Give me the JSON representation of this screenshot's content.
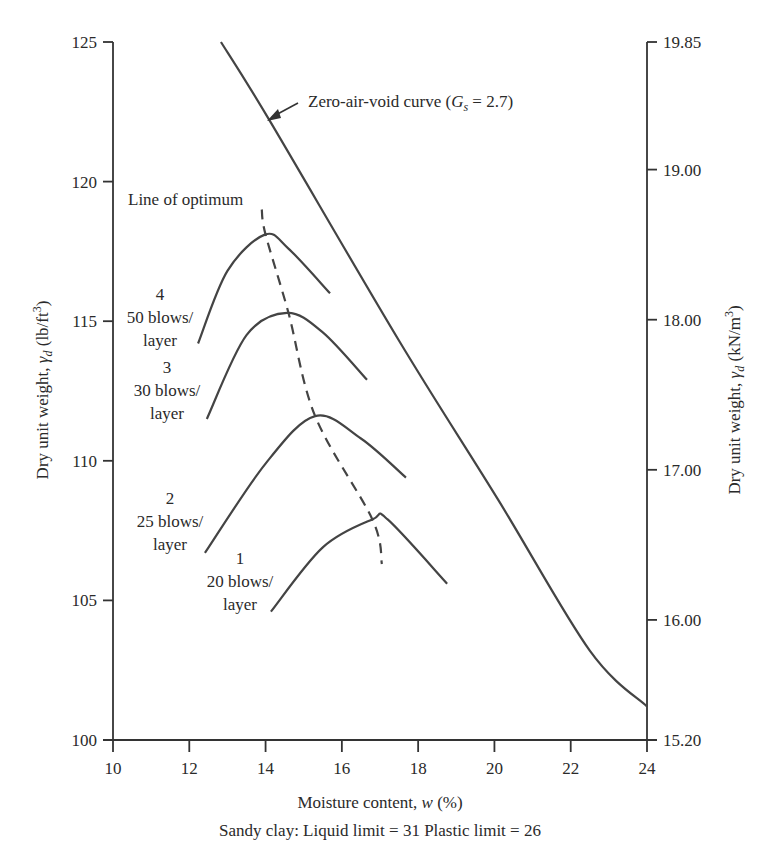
{
  "chart_data": {
    "type": "line",
    "title": "",
    "xlabel": "Moisture content, w (%)",
    "ylabel_left": "Dry unit weight, γd (lb/ft³)",
    "ylabel_right": "Dry unit weight, γd (kN/m³)",
    "caption": "Sandy clay: Liquid limit = 31 Plastic limit = 26",
    "xlim": [
      10,
      24
    ],
    "ylim_left": [
      100,
      125
    ],
    "ylim_right": [
      15.2,
      19.85
    ],
    "x_ticks": [
      "10",
      "12",
      "14",
      "16",
      "18",
      "20",
      "22",
      "24"
    ],
    "y_ticks_left": [
      "100",
      "105",
      "110",
      "115",
      "120",
      "125"
    ],
    "y_ticks_right": [
      "15.20",
      "16.00",
      "17.00",
      "18.00",
      "19.00",
      "19.85"
    ],
    "grid": false,
    "series": [
      {
        "name": "Zero-air-void curve (Gs = 2.7)",
        "style": "solid",
        "x": [
          12.83,
          14.1,
          17.5,
          20.1,
          22.5,
          24.0
        ],
        "y": [
          125.0,
          122.2,
          114.3,
          108.6,
          103.2,
          101.2
        ]
      },
      {
        "name": "4 - 50 blows/layer",
        "style": "solid",
        "x": [
          12.23,
          13.0,
          13.98,
          14.6,
          15.69
        ],
        "y": [
          114.2,
          116.8,
          118.1,
          117.6,
          116.0
        ]
      },
      {
        "name": "3 - 30 blows/layer",
        "style": "solid",
        "x": [
          12.46,
          13.5,
          14.56,
          15.5,
          16.66
        ],
        "y": [
          111.5,
          114.5,
          115.3,
          114.6,
          112.9
        ]
      },
      {
        "name": "2 - 25 blows/layer",
        "style": "solid",
        "x": [
          12.41,
          14.0,
          15.3,
          16.5,
          17.68
        ],
        "y": [
          106.7,
          109.9,
          111.6,
          110.8,
          109.4
        ]
      },
      {
        "name": "1 - 20 blows/layer",
        "style": "solid",
        "x": [
          14.14,
          15.5,
          16.8,
          17.2,
          18.76
        ],
        "y": [
          104.6,
          106.9,
          107.9,
          107.9,
          105.6
        ]
      },
      {
        "name": "Line of optimum",
        "style": "dashed",
        "x": [
          13.9,
          14.0,
          14.6,
          15.3,
          16.8,
          17.05
        ],
        "y": [
          119.0,
          118.1,
          115.3,
          111.6,
          107.9,
          106.3
        ]
      }
    ],
    "annotations": [
      {
        "text": "Zero-air-void curve (G_s = 2.7)",
        "arrow": true
      },
      {
        "text": "Line of optimum"
      },
      {
        "text": "4 50 blows/ layer"
      },
      {
        "text": "3 30 blows/ layer"
      },
      {
        "text": "2 25 blows/ layer"
      },
      {
        "text": "1 20 blows/ layer"
      }
    ]
  },
  "labels": {
    "zav_main": "Zero-air-void curve (",
    "zav_G": "G",
    "zav_s": "s",
    "zav_tail": " = 2.7)",
    "optimum": "Line of optimum",
    "c4": [
      "4",
      "50 blows/",
      "layer"
    ],
    "c3": [
      "3",
      "30 blows/",
      "layer"
    ],
    "c2": [
      "2",
      "25 blows/",
      "layer"
    ],
    "c1": [
      "1",
      "20 blows/",
      "layer"
    ],
    "xlabel_main": "Moisture content, ",
    "xlabel_w": "w",
    "xlabel_tail": " (%)",
    "caption": "Sandy clay: Liquid limit = 31 Plastic limit = 26",
    "yleft_main": "Dry unit weight, ",
    "yleft_gamma": "γ",
    "yleft_d": "d",
    "yleft_tail": " (lb/ft",
    "yleft_sup": "3",
    "yleft_close": ")",
    "yright_main": "Dry unit weight, ",
    "yright_gamma": "γ",
    "yright_d": "d",
    "yright_tail": " (kN/m",
    "yright_sup": "3",
    "yright_close": ")"
  },
  "colors": {
    "line": "#444444",
    "text": "#2a2a2a",
    "background": "#ffffff"
  }
}
